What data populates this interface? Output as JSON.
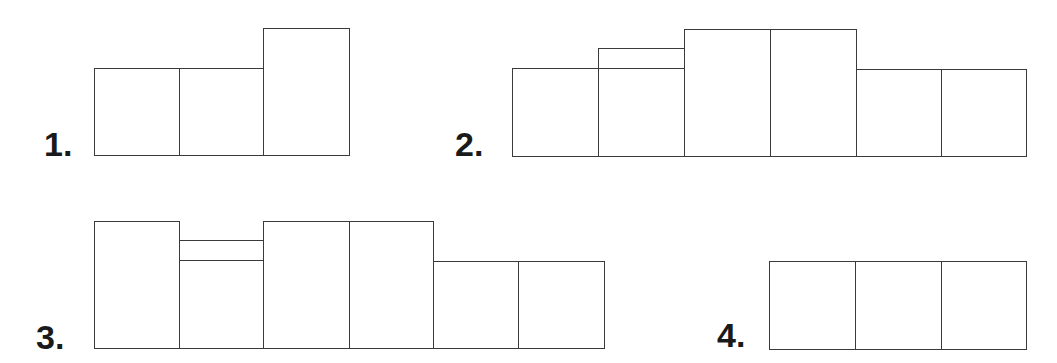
{
  "figures": [
    {
      "label": "1.",
      "label_pos": [
        44,
        127
      ],
      "boxes": [
        {
          "x": 94,
          "y": 68,
          "w": 85,
          "h": 87
        },
        {
          "x": 179,
          "y": 68,
          "w": 84,
          "h": 87
        },
        {
          "x": 263,
          "y": 28,
          "w": 86,
          "h": 127
        }
      ]
    },
    {
      "label": "2.",
      "label_pos": [
        455,
        127
      ],
      "boxes": [
        {
          "x": 512,
          "y": 68,
          "w": 86,
          "h": 88
        },
        {
          "x": 598,
          "y": 68,
          "w": 86,
          "h": 88
        },
        {
          "x": 598,
          "y": 48,
          "w": 86,
          "h": 20
        },
        {
          "x": 684,
          "y": 29,
          "w": 86,
          "h": 127
        },
        {
          "x": 770,
          "y": 29,
          "w": 86,
          "h": 127
        },
        {
          "x": 856,
          "y": 69,
          "w": 85,
          "h": 87
        },
        {
          "x": 941,
          "y": 69,
          "w": 85,
          "h": 87
        }
      ]
    },
    {
      "label": "3.",
      "label_pos": [
        36,
        320
      ],
      "boxes": [
        {
          "x": 94,
          "y": 221,
          "w": 85,
          "h": 127
        },
        {
          "x": 179,
          "y": 260,
          "w": 84,
          "h": 88
        },
        {
          "x": 179,
          "y": 240,
          "w": 84,
          "h": 20
        },
        {
          "x": 263,
          "y": 221,
          "w": 86,
          "h": 127
        },
        {
          "x": 349,
          "y": 221,
          "w": 84,
          "h": 127
        },
        {
          "x": 433,
          "y": 261,
          "w": 85,
          "h": 87
        },
        {
          "x": 518,
          "y": 261,
          "w": 86,
          "h": 87
        }
      ]
    },
    {
      "label": "4.",
      "label_pos": [
        717,
        315
      ],
      "boxes": [
        {
          "x": 769,
          "y": 261,
          "w": 86,
          "h": 88
        },
        {
          "x": 855,
          "y": 261,
          "w": 86,
          "h": 88
        },
        {
          "x": 941,
          "y": 261,
          "w": 85,
          "h": 88
        }
      ]
    }
  ],
  "colors": {
    "line": "#3a3a3a",
    "label": "#1a1a1a",
    "background": "#ffffff"
  }
}
